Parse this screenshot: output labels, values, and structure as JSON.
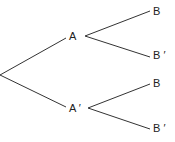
{
  "diagram": {
    "type": "probability-tree",
    "root": "",
    "level1": [
      {
        "label": "A",
        "children": [
          {
            "label": "B"
          },
          {
            "label": "B ′"
          }
        ]
      },
      {
        "label": "A ′",
        "children": [
          {
            "label": "B"
          },
          {
            "label": "B ′"
          }
        ]
      }
    ],
    "line_color": "#333333"
  }
}
